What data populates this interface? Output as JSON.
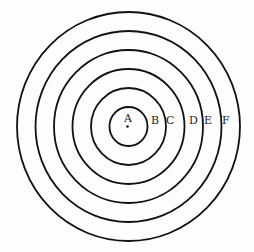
{
  "diagram": {
    "type": "concentric-circles",
    "center": {
      "x": 128.5,
      "y": 126.5
    },
    "center_dot": true,
    "rings": [
      {
        "label": "A",
        "rx": 19,
        "ry": 19.5
      },
      {
        "label": "B",
        "rx": 37.5,
        "ry": 38.5
      },
      {
        "label": "C",
        "rx": 56,
        "ry": 57.5
      },
      {
        "label": "D",
        "rx": 74.5,
        "ry": 76.5
      },
      {
        "label": "E",
        "rx": 93,
        "ry": 95.5
      },
      {
        "label": "F",
        "rx": 111.5,
        "ry": 114.5
      }
    ],
    "labels": [
      {
        "text": "A",
        "x": 124,
        "y": 122
      },
      {
        "text": "B",
        "x": 151,
        "y": 124
      },
      {
        "text": "C",
        "x": 166,
        "y": 124
      },
      {
        "text": "D",
        "x": 189,
        "y": 124
      },
      {
        "text": "E",
        "x": 204,
        "y": 124
      },
      {
        "text": "F",
        "x": 222,
        "y": 124
      }
    ],
    "stroke_color": "#111111"
  }
}
